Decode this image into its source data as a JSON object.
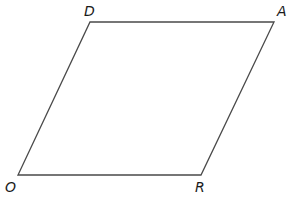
{
  "diagram": {
    "type": "parallelogram",
    "name": "DARO",
    "stroke_color": "#4a4a4a",
    "background": "#ffffff",
    "vertices": [
      {
        "label": "D",
        "x": 90,
        "y": 22,
        "label_x": 84,
        "label_y": 4
      },
      {
        "label": "A",
        "x": 274,
        "y": 22,
        "label_x": 277,
        "label_y": 4
      },
      {
        "label": "R",
        "x": 201,
        "y": 175,
        "label_x": 195,
        "label_y": 180
      },
      {
        "label": "O",
        "x": 18,
        "y": 175,
        "label_x": 5,
        "label_y": 180
      }
    ],
    "edges": [
      [
        "D",
        "A"
      ],
      [
        "A",
        "R"
      ],
      [
        "R",
        "O"
      ],
      [
        "O",
        "D"
      ]
    ]
  }
}
